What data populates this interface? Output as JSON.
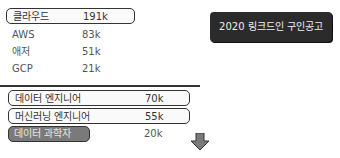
{
  "title": "2020 링크드인 구인공고",
  "cloud": {
    "items": [
      {
        "label": "클라우드",
        "value": "191k"
      },
      {
        "label": "AWS",
        "value": "83k"
      },
      {
        "label": "애저",
        "value": "51k"
      },
      {
        "label": "GCP",
        "value": "21k"
      }
    ]
  },
  "jobs": {
    "items": [
      {
        "label": "데이터 엔지니어",
        "value": "70k"
      },
      {
        "label": "머신러닝 엔지니어",
        "value": "55k"
      },
      {
        "label": "데이터 과학자",
        "value": "20k"
      }
    ]
  },
  "colors": {
    "title_bg": "#2b2b2b",
    "highlight_bg": "#7a7a7a"
  },
  "icons": {
    "arrow": "down-arrow-icon"
  }
}
